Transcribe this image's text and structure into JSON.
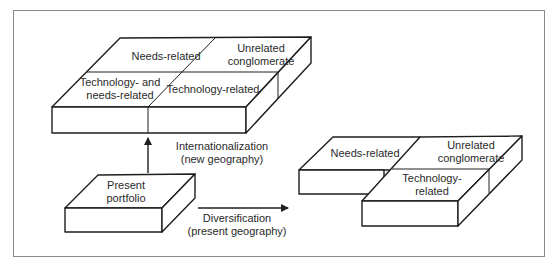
{
  "diagram": {
    "top_block": {
      "cells": {
        "needs_related": "Needs-related",
        "unrelated_line1": "Unrelated",
        "unrelated_line2": "conglomerate",
        "tech_needs_line1": "Technology- and",
        "tech_needs_line2": "needs-related",
        "technology_related": "Technology-related"
      }
    },
    "present_block": {
      "line1": "Present",
      "line2": "portfolio"
    },
    "right_block": {
      "cells": {
        "needs_related": "Needs-related",
        "unrelated_line1": "Unrelated",
        "unrelated_line2": "conglomerate",
        "tech_line1": "Technology-",
        "tech_line2": "related"
      }
    },
    "arrows": {
      "internationalization": {
        "line1": "Internationalization",
        "line2": "(new geography)"
      },
      "diversification": {
        "line1": "Diversification",
        "line2": "(present geography)"
      }
    },
    "colors": {
      "line": "#1e1e1e",
      "text": "#2a2a2a",
      "frame": "#8a8a8a"
    }
  }
}
